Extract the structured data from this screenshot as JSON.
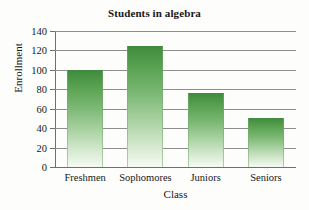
{
  "chart_data": {
    "type": "bar",
    "title": "Students in algebra",
    "xlabel": "Class",
    "ylabel": "Enrollment",
    "categories": [
      "Freshmen",
      "Sophomores",
      "Juniors",
      "Seniors"
    ],
    "values": [
      100,
      125,
      76,
      50
    ],
    "ylim": [
      0,
      140
    ],
    "ytick_labels": [
      "0",
      "20",
      "40",
      "60",
      "80",
      "100",
      "120",
      "140"
    ],
    "ytick_values": [
      0,
      20,
      40,
      60,
      80,
      100,
      120,
      140
    ],
    "grid": "horizontal",
    "legend": "none",
    "bar_color_top": "#3f8a3c",
    "bar_color_bottom": "#f6fbf4",
    "axis_color": "#6f6f6f",
    "gridline_color": "#8d8d8d"
  }
}
